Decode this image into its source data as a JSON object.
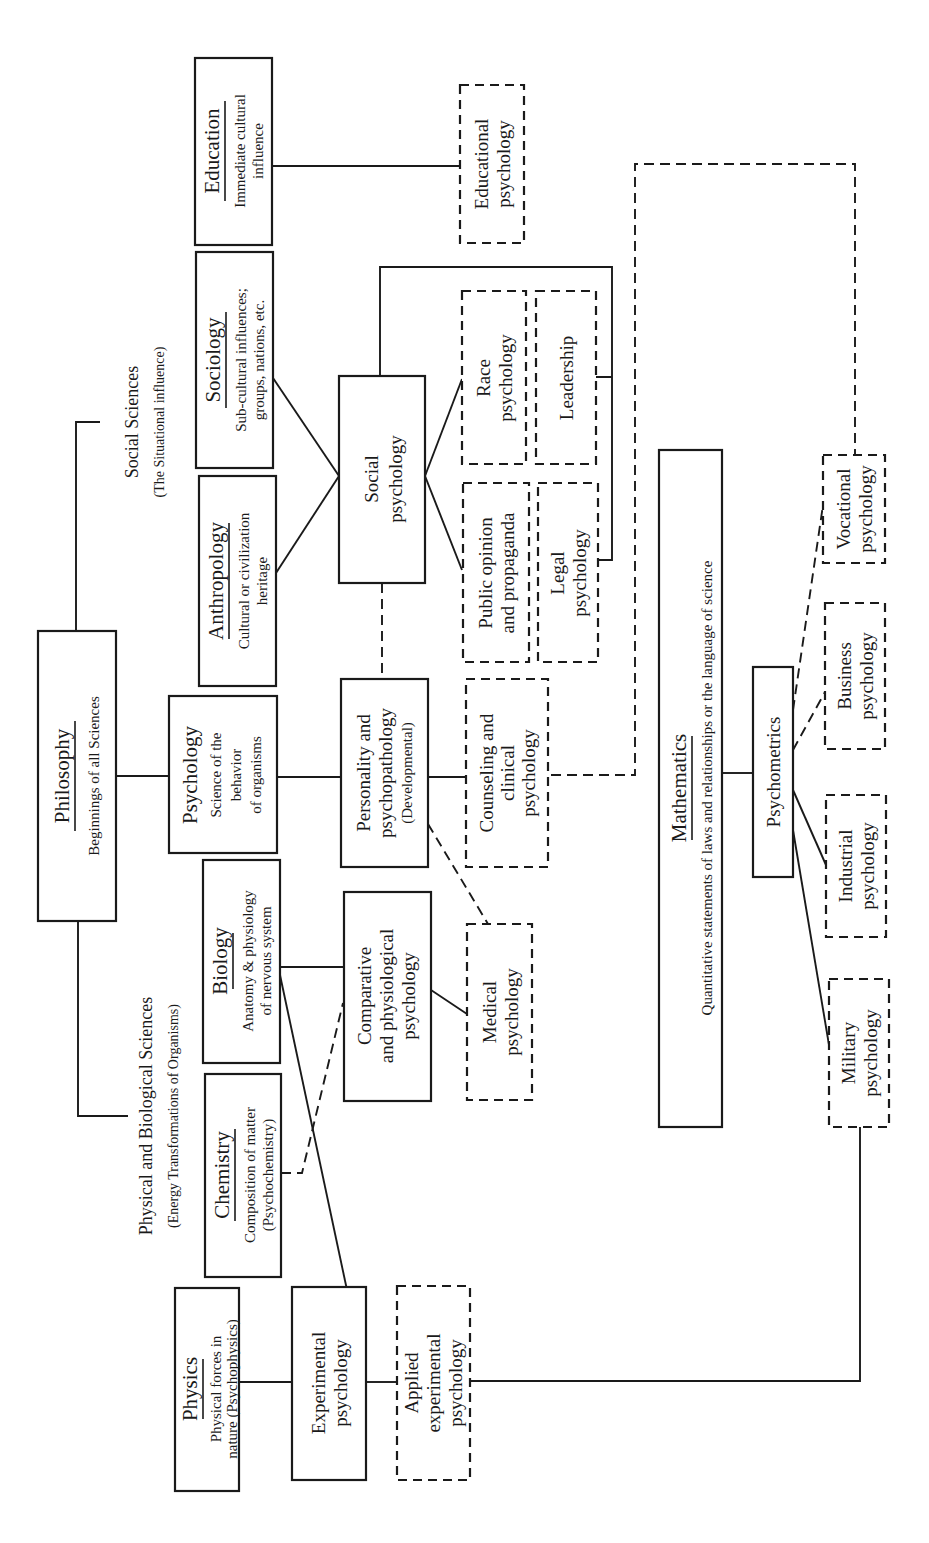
{
  "diagram": {
    "orientation": "rotated-90-ccw",
    "categories": {
      "social_sciences": {
        "title": "Social Sciences",
        "subtitle": "(The Situational influence)"
      },
      "physical_biological": {
        "title": "Physical and Biological Sciences",
        "subtitle": "(Energy Transformations of Organisms)"
      }
    },
    "nodes": {
      "philosophy": {
        "title": "Philosophy",
        "lines": [
          "Beginnings of all Sciences"
        ],
        "style": "solid"
      },
      "education": {
        "title": "Education",
        "lines": [
          "Immediate cultural",
          "influence"
        ],
        "style": "solid"
      },
      "sociology": {
        "title": "Sociology",
        "lines": [
          "Sub-cultural influences;",
          "groups, nations, etc."
        ],
        "style": "solid"
      },
      "anthropology": {
        "title": "Anthropology",
        "lines": [
          "Cultural or civilization",
          "heritage"
        ],
        "style": "solid"
      },
      "psychology": {
        "title": "Psychology",
        "lines": [
          "Science of the",
          "behavior",
          "of organisms"
        ],
        "style": "solid"
      },
      "biology": {
        "title": "Biology",
        "lines": [
          "Anatomy & physiology",
          "of nervous system"
        ],
        "style": "solid"
      },
      "chemistry": {
        "title": "Chemistry",
        "lines": [
          "Composition of matter",
          "(Psychochemistry)"
        ],
        "style": "solid"
      },
      "physics": {
        "title": "Physics",
        "lines": [
          "Physical forces in",
          "nature (Psychophysics)"
        ],
        "style": "solid"
      },
      "mathematics": {
        "title": "Mathematics",
        "lines": [
          "Quantitative statements of laws and relationships or the language of science"
        ],
        "style": "solid"
      },
      "social_psychology": {
        "lines": [
          "Social",
          "psychology"
        ],
        "style": "solid"
      },
      "personality": {
        "lines": [
          "Personality and",
          "psychopathology",
          "(Developmental)"
        ],
        "style": "solid"
      },
      "comparative": {
        "lines": [
          "Comparative",
          "and physiological",
          "psychology"
        ],
        "style": "solid"
      },
      "experimental": {
        "lines": [
          "Experimental",
          "psychology"
        ],
        "style": "solid"
      },
      "psychometrics": {
        "lines": [
          "Psychometrics"
        ],
        "style": "solid"
      },
      "educational_psychology": {
        "lines": [
          "Educational",
          "psychology"
        ],
        "style": "dashed"
      },
      "race_psychology": {
        "lines": [
          "Race",
          "psychology"
        ],
        "style": "dashed"
      },
      "leadership": {
        "lines": [
          "Leadership"
        ],
        "style": "dashed"
      },
      "public_opinion": {
        "lines": [
          "Public opinion",
          "and propaganda"
        ],
        "style": "dashed"
      },
      "legal_psychology": {
        "lines": [
          "Legal",
          "psychology"
        ],
        "style": "dashed"
      },
      "counseling": {
        "lines": [
          "Counseling and",
          "clinical",
          "psychology"
        ],
        "style": "dashed"
      },
      "medical_psychology": {
        "lines": [
          "Medical",
          "psychology"
        ],
        "style": "dashed"
      },
      "applied_experimental": {
        "lines": [
          "Applied",
          "experimental",
          "psychology"
        ],
        "style": "dashed"
      },
      "vocational": {
        "lines": [
          "Vocational",
          "psychology"
        ],
        "style": "dashed"
      },
      "business": {
        "lines": [
          "Business",
          "psychology"
        ],
        "style": "dashed"
      },
      "industrial": {
        "lines": [
          "Industrial",
          "psychology"
        ],
        "style": "dashed"
      },
      "military": {
        "lines": [
          "Military",
          "psychology"
        ],
        "style": "dashed"
      }
    },
    "edges": [
      {
        "from": "philosophy",
        "to": "social_sciences",
        "style": "solid"
      },
      {
        "from": "philosophy",
        "to": "physical_biological",
        "style": "solid"
      },
      {
        "from": "philosophy",
        "to": "psychology",
        "style": "solid"
      },
      {
        "from": "education",
        "to": "educational_psychology",
        "style": "solid"
      },
      {
        "from": "sociology",
        "to": "social_psychology",
        "style": "solid"
      },
      {
        "from": "anthropology",
        "to": "social_psychology",
        "style": "solid"
      },
      {
        "from": "social_psychology",
        "to": "race_psychology",
        "style": "solid"
      },
      {
        "from": "social_psychology",
        "to": "public_opinion",
        "style": "solid"
      },
      {
        "from": "social_psychology",
        "to": "leadership",
        "style": "solid"
      },
      {
        "from": "social_psychology",
        "to": "legal_psychology",
        "style": "solid"
      },
      {
        "from": "social_psychology",
        "to": "personality",
        "style": "dashed"
      },
      {
        "from": "psychology",
        "to": "personality",
        "style": "solid"
      },
      {
        "from": "personality",
        "to": "counseling",
        "style": "solid"
      },
      {
        "from": "personality",
        "to": "medical_psychology",
        "style": "dashed"
      },
      {
        "from": "counseling",
        "to": "vocational",
        "style": "dashed"
      },
      {
        "from": "biology",
        "to": "comparative",
        "style": "solid"
      },
      {
        "from": "biology",
        "to": "experimental",
        "style": "solid"
      },
      {
        "from": "chemistry",
        "to": "comparative",
        "style": "dashed"
      },
      {
        "from": "comparative",
        "to": "medical_psychology",
        "style": "solid"
      },
      {
        "from": "physics",
        "to": "experimental",
        "style": "solid"
      },
      {
        "from": "experimental",
        "to": "applied_experimental",
        "style": "solid"
      },
      {
        "from": "applied_experimental",
        "to": "military",
        "style": "solid"
      },
      {
        "from": "mathematics",
        "to": "psychometrics",
        "style": "solid"
      },
      {
        "from": "psychometrics",
        "to": "vocational",
        "style": "dashed"
      },
      {
        "from": "psychometrics",
        "to": "business",
        "style": "dashed"
      },
      {
        "from": "psychometrics",
        "to": "industrial",
        "style": "solid"
      },
      {
        "from": "psychometrics",
        "to": "military",
        "style": "solid"
      }
    ],
    "colors": {
      "ink": "#1a1a1a",
      "paper": "#ffffff"
    }
  }
}
